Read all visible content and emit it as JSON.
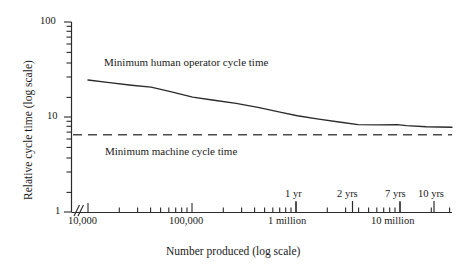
{
  "chart_data": {
    "type": "line",
    "title": "",
    "xlabel": "Number produced (log scale)",
    "ylabel": "Relative cycle time (log scale)",
    "xscale": "log",
    "yscale": "log",
    "xlim": [
      10000,
      30000000
    ],
    "ylim": [
      1,
      100
    ],
    "grid": false,
    "legend": "inline-labels",
    "axis_break": "//",
    "y_tick_labels": [
      "100",
      "10",
      "1"
    ],
    "y_tick_values": [
      100,
      10,
      1
    ],
    "x_tick_labels": [
      "10,000",
      "100,000",
      "1 million",
      "10 million"
    ],
    "x_tick_values": [
      10000,
      100000,
      1000000,
      10000000
    ],
    "annotations": [
      {
        "label": "1 yr",
        "x": 1000000
      },
      {
        "label": "2 yrs",
        "x": 3500000
      },
      {
        "label": "7 yrs",
        "x": 10000000
      },
      {
        "label": "10 yrs",
        "x": 19000000
      }
    ],
    "series": [
      {
        "name": "Minimum human operator cycle time",
        "style": "solid",
        "label_text": "Minimum human operator cycle time",
        "points": [
          {
            "x": 10000,
            "y": 24.5
          },
          {
            "x": 16000,
            "y": 23.0
          },
          {
            "x": 26000,
            "y": 21.6
          },
          {
            "x": 40000,
            "y": 20.6
          },
          {
            "x": 60000,
            "y": 18.6
          },
          {
            "x": 100000,
            "y": 16.2
          },
          {
            "x": 160000,
            "y": 15.0
          },
          {
            "x": 260000,
            "y": 13.9
          },
          {
            "x": 420000,
            "y": 12.6
          },
          {
            "x": 700000,
            "y": 11.2
          },
          {
            "x": 1000000,
            "y": 10.3
          },
          {
            "x": 1600000,
            "y": 9.5
          },
          {
            "x": 2600000,
            "y": 8.8
          },
          {
            "x": 3800000,
            "y": 8.3
          },
          {
            "x": 6000000,
            "y": 8.25
          },
          {
            "x": 9000000,
            "y": 8.3
          },
          {
            "x": 11000000,
            "y": 8.1
          },
          {
            "x": 17000000,
            "y": 7.9
          },
          {
            "x": 30000000,
            "y": 7.8
          }
        ]
      },
      {
        "name": "Minimum machine cycle time",
        "style": "dashed",
        "label_text": "Minimum machine cycle time",
        "constant_y": 6.5
      }
    ]
  },
  "axes": {
    "y_title": "Relative cycle time (log scale)",
    "x_title": "Number produced (log scale)",
    "y_labels": {
      "top": "100",
      "mid": "10",
      "bottom": "1"
    },
    "x_labels": {
      "t1": "10,000",
      "t2": "100,000",
      "t3": "1 million",
      "t4": "10 million"
    }
  },
  "annotations": {
    "yr1": "1 yr",
    "yr2": "2 yrs",
    "yr7": "7 yrs",
    "yr10": "10 yrs",
    "human_curve": "Minimum human operator cycle time",
    "machine_line": "Minimum machine cycle time"
  },
  "colors": {
    "ink": "#1a1a1a",
    "axis": "#333333",
    "curve": "#2b2b2b",
    "dash": "#4a4a4a",
    "background": "#ffffff"
  }
}
